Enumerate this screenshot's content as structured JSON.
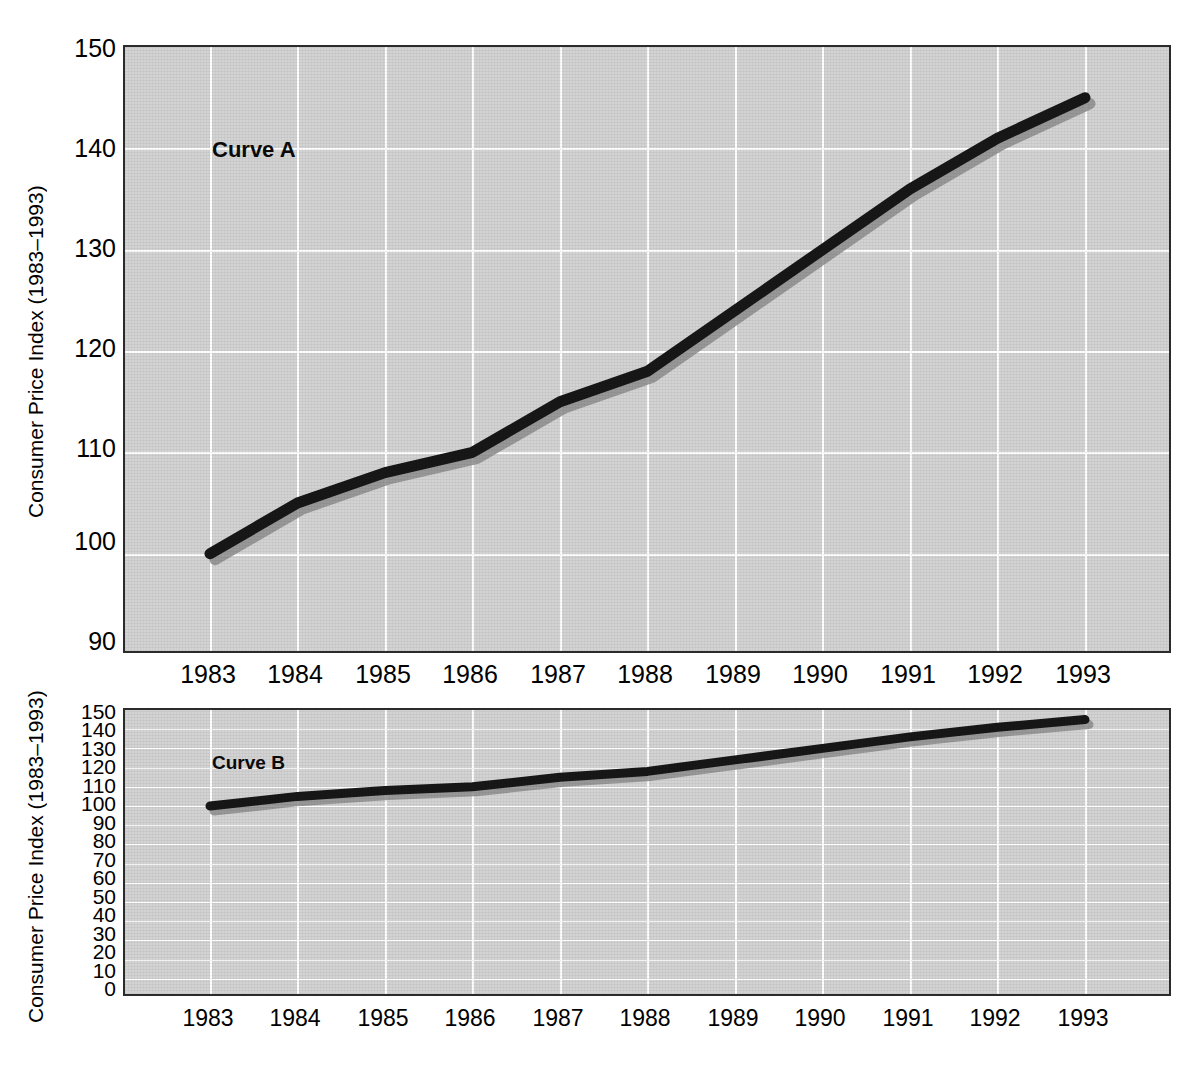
{
  "chart_data": [
    {
      "type": "line",
      "name": "Curve A",
      "annotation": "Curve A",
      "title": "",
      "xlabel": "",
      "ylabel": "Consumer Price Index (1983–1993)",
      "categories": [
        "1983",
        "1984",
        "1985",
        "1986",
        "1987",
        "1988",
        "1989",
        "1990",
        "1991",
        "1992",
        "1993"
      ],
      "x": [
        1983,
        1984,
        1985,
        1986,
        1987,
        1988,
        1989,
        1990,
        1991,
        1992,
        1993
      ],
      "values": [
        100,
        105,
        108,
        110,
        115,
        118,
        124,
        130,
        136,
        141,
        145
      ],
      "ylim": [
        90,
        150
      ],
      "yticks": [
        90,
        100,
        110,
        120,
        130,
        140,
        150
      ],
      "ytick_labels": [
        "90",
        "100",
        "110",
        "120",
        "130",
        "140",
        "150"
      ],
      "xtick_labels": [
        "1983",
        "1984",
        "1985",
        "1986",
        "1987",
        "1988",
        "1989",
        "1990",
        "1991",
        "1992",
        "1993"
      ],
      "grid": true,
      "legend": "none",
      "line_color": "#171717",
      "plot_bg": "#d3d3d3",
      "grid_color": "#ffffff"
    },
    {
      "type": "line",
      "name": "Curve B",
      "annotation": "Curve B",
      "title": "",
      "xlabel": "",
      "ylabel": "Consumer Price Index (1983–1993)",
      "categories": [
        "1983",
        "1984",
        "1985",
        "1986",
        "1987",
        "1988",
        "1989",
        "1990",
        "1991",
        "1992",
        "1993"
      ],
      "x": [
        1983,
        1984,
        1985,
        1986,
        1987,
        1988,
        1989,
        1990,
        1991,
        1992,
        1993
      ],
      "values": [
        100,
        105,
        108,
        110,
        115,
        118,
        124,
        130,
        136,
        141,
        145
      ],
      "ylim": [
        0,
        150
      ],
      "yticks": [
        0,
        10,
        20,
        30,
        40,
        50,
        60,
        70,
        80,
        90,
        100,
        110,
        120,
        130,
        140,
        150
      ],
      "ytick_labels": [
        "0",
        "10",
        "20",
        "30",
        "40",
        "50",
        "60",
        "70",
        "80",
        "90",
        "100",
        "110",
        "120",
        "130",
        "140",
        "150"
      ],
      "xtick_labels": [
        "1983",
        "1984",
        "1985",
        "1986",
        "1987",
        "1988",
        "1989",
        "1990",
        "1991",
        "1992",
        "1993"
      ],
      "grid": true,
      "legend": "none",
      "line_color": "#171717",
      "plot_bg": "#d3d3d3",
      "grid_color": "#ffffff"
    }
  ],
  "top_chart": {
    "axis_title": "Consumer Price Index (1983–1993)",
    "curve_label": "Curve A",
    "y_ticks": [
      "150",
      "140",
      "130",
      "120",
      "110",
      "100",
      "90"
    ],
    "x_ticks": [
      "1983",
      "1984",
      "1985",
      "1986",
      "1987",
      "1988",
      "1989",
      "1990",
      "1991",
      "1992",
      "1993"
    ]
  },
  "bottom_chart": {
    "axis_title": "Consumer Price Index (1983–1993)",
    "curve_label": "Curve B",
    "y_ticks": [
      "150",
      "140",
      "130",
      "120",
      "110",
      "100",
      "90",
      "80",
      "70",
      "60",
      "50",
      "40",
      "30",
      "20",
      "10",
      "0"
    ],
    "x_ticks": [
      "1983",
      "1984",
      "1985",
      "1986",
      "1987",
      "1988",
      "1989",
      "1990",
      "1991",
      "1992",
      "1993"
    ]
  }
}
